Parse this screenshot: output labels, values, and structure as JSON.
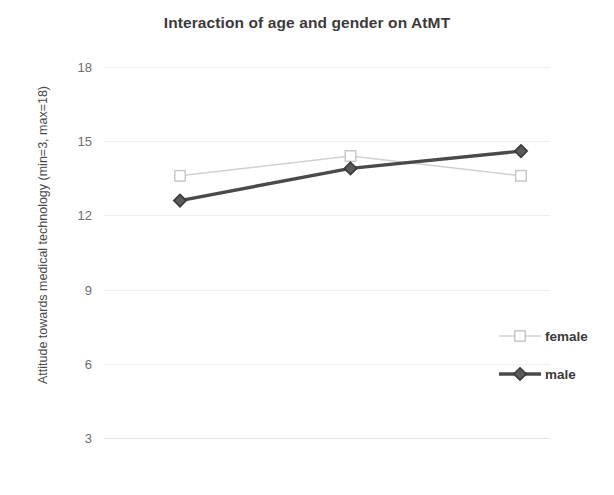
{
  "chart_data": {
    "type": "line",
    "title": "Interaction of age and gender on AtMT",
    "xlabel": "",
    "ylabel": "Attitude towards medical technology  (min=3, max=18)",
    "categories": [
      "<40 years",
      "40-59 years",
      "60+ years"
    ],
    "yticks": [
      18,
      15,
      12,
      9,
      6,
      3
    ],
    "ylim": [
      3,
      18
    ],
    "grid": true,
    "legend_position": "right",
    "series": [
      {
        "name": "female",
        "values": [
          13.6,
          14.4,
          13.6
        ],
        "color": "#d0d0d0",
        "marker": "open-square",
        "marker_edge_color": "#c9c9c9",
        "marker_fill": "#ffffff",
        "line_width": 1.6
      },
      {
        "name": "male",
        "values": [
          12.6,
          13.9,
          14.6
        ],
        "color": "#4a4a4a",
        "marker": "filled-diamond",
        "marker_edge_color": "#3b3b3b",
        "marker_fill": "#5a5a5a",
        "line_width": 3.4
      }
    ]
  },
  "axes": {
    "y_tick_labels": [
      "18",
      "15",
      "12",
      "9",
      "6",
      "3"
    ],
    "x_tick_labels": [
      "<40 years",
      "40-59 years",
      "60+ years"
    ]
  },
  "legend": {
    "items": [
      {
        "label": "female"
      },
      {
        "label": "male"
      }
    ]
  }
}
